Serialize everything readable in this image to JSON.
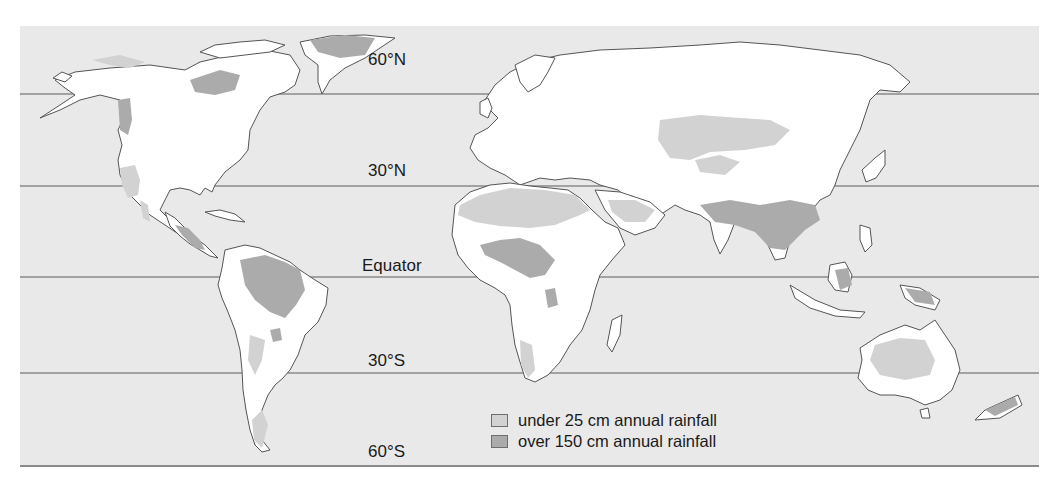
{
  "map": {
    "type": "world-precipitation-map",
    "colors": {
      "ocean": "#e9e9e9",
      "land": "#ffffff",
      "dry": "#d2d2d2",
      "wet": "#ababab",
      "coast": "#555555",
      "latitude_line": "#8a8a8a"
    },
    "latitude_lines": [
      {
        "label": "60°N",
        "y": 94
      },
      {
        "label": "30°N",
        "y": 186
      },
      {
        "label": "Equator",
        "y": 277
      },
      {
        "label": "30°S",
        "y": 373
      },
      {
        "label": "60°S",
        "y": 465
      }
    ]
  },
  "legend": {
    "items": [
      {
        "label": "under 25 cm annual rainfall",
        "color": "#d2d2d2"
      },
      {
        "label": "over 150 cm annual rainfall",
        "color": "#ababab"
      }
    ]
  }
}
